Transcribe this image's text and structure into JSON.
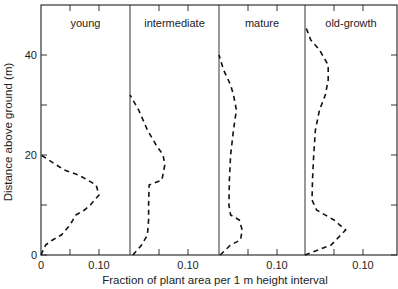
{
  "chart_data": {
    "type": "line",
    "title": "",
    "xlabel": "Fraction of plant area per 1 m height interval",
    "ylabel": "Distance above ground (m)",
    "ylim": [
      0,
      50
    ],
    "yticks": [
      0,
      10,
      20,
      30,
      40
    ],
    "ytick_labels": [
      "0",
      "",
      "20",
      "",
      "40"
    ],
    "grid": false,
    "legend": null,
    "line_style": "dashed",
    "line_color": "#111111",
    "panels": [
      {
        "name": "young",
        "xlim": [
          0,
          0.155
        ],
        "xticks": [
          0,
          0.05,
          0.1
        ],
        "xtick_labels": [
          "0",
          "",
          "0.10"
        ],
        "series": {
          "x": [
            0.0,
            0.008,
            0.02,
            0.035,
            0.05,
            0.06,
            0.075,
            0.085,
            0.1,
            0.095,
            0.065,
            0.04,
            0.0
          ],
          "y": [
            0,
            2,
            3,
            4,
            6,
            8,
            9,
            10,
            12,
            14,
            16,
            17,
            20
          ]
        }
      },
      {
        "name": "intermediate",
        "xlim": [
          0,
          0.155
        ],
        "xticks": [
          0.05,
          0.1
        ],
        "xtick_labels": [
          "",
          "0.10"
        ],
        "series": {
          "x": [
            0.005,
            0.02,
            0.03,
            0.032,
            0.032,
            0.033,
            0.055,
            0.06,
            0.057,
            0.045,
            0.03,
            0.015,
            0.0
          ],
          "y": [
            0,
            2,
            4,
            7,
            10,
            14,
            15,
            18,
            20,
            22,
            25,
            29,
            32
          ]
        }
      },
      {
        "name": "mature",
        "xlim": [
          0,
          0.155
        ],
        "xticks": [
          0.05,
          0.1
        ],
        "xtick_labels": [
          "",
          "0.10"
        ],
        "series": {
          "x": [
            0.002,
            0.02,
            0.037,
            0.04,
            0.035,
            0.02,
            0.017,
            0.018,
            0.02,
            0.025,
            0.03,
            0.025,
            0.02,
            0.008,
            0.0
          ],
          "y": [
            0,
            2,
            3,
            5,
            7,
            8,
            10,
            15,
            20,
            25,
            29,
            32,
            34,
            37,
            40
          ]
        }
      },
      {
        "name": "old-growth",
        "xlim": [
          0,
          0.155
        ],
        "xticks": [
          0.05,
          0.1
        ],
        "xtick_labels": [
          "",
          "0.10"
        ],
        "series": {
          "x": [
            0.0,
            0.045,
            0.07,
            0.05,
            0.02,
            0.012,
            0.013,
            0.015,
            0.018,
            0.025,
            0.035,
            0.04,
            0.04,
            0.025,
            0.01,
            0.0
          ],
          "y": [
            0,
            2,
            5,
            7,
            9,
            11,
            15,
            20,
            25,
            29,
            32,
            35,
            38,
            41,
            43,
            46
          ]
        }
      }
    ]
  },
  "labels": {
    "xlabel": "Fraction of plant area per 1 m height interval",
    "ylabel": "Distance above ground (m)"
  }
}
